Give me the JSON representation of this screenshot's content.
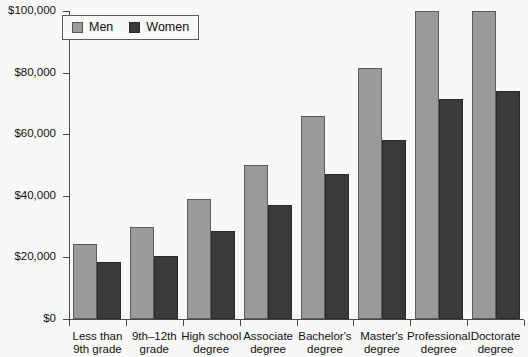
{
  "chart_data": {
    "type": "bar",
    "title": "",
    "xlabel": "",
    "ylabel": "",
    "ylim": [
      0,
      100000
    ],
    "grid": false,
    "legend_position": "top-left",
    "categories": [
      "Less than\n9th grade",
      "9th–12th\ngrade",
      "High school\ndegree",
      "Associate\ndegree",
      "Bachelor's\ndegree",
      "Master's\ndegree",
      "Professional\ndegree",
      "Doctorate\ndegree"
    ],
    "category_lines": [
      [
        "Less than",
        "9th grade"
      ],
      [
        "9th–12th",
        "grade"
      ],
      [
        "High school",
        "degree"
      ],
      [
        "Associate",
        "degree"
      ],
      [
        "Bachelor's",
        "degree"
      ],
      [
        "Master's",
        "degree"
      ],
      [
        "Professional",
        "degree"
      ],
      [
        "Doctorate",
        "degree"
      ]
    ],
    "series": [
      {
        "name": "Men",
        "color": "#9a9a9a",
        "values": [
          24400,
          29900,
          39000,
          50000,
          66000,
          81500,
          100000,
          100000
        ]
      },
      {
        "name": "Women",
        "color": "#3a3a3a",
        "values": [
          18500,
          20500,
          28500,
          37000,
          47000,
          58000,
          71500,
          74000
        ]
      }
    ],
    "ytick_values": [
      0,
      20000,
      40000,
      60000,
      80000,
      100000
    ],
    "ytick_labels": [
      "$0",
      "$20,000",
      "$40,000",
      "$60,000",
      "$80,000",
      "$100,000"
    ]
  },
  "legend": {
    "entries": [
      {
        "label": "Men",
        "swatch": "men-swatch"
      },
      {
        "label": "Women",
        "swatch": "women-swatch"
      }
    ]
  }
}
